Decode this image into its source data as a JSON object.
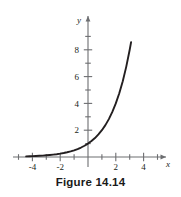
{
  "figure": {
    "caption": "Figure 14.14"
  },
  "chart_data": {
    "type": "line",
    "title": "",
    "subtitle": "",
    "xlabel": "x",
    "ylabel": "y",
    "grid": false,
    "legend": null,
    "xlim": [
      -4.6,
      4.6
    ],
    "ylim": [
      -0.55,
      9.2
    ],
    "x_ticks_major": [
      -4,
      -2,
      2,
      4
    ],
    "x_ticks_minor": [
      -3,
      -1,
      1,
      3
    ],
    "x_tick_labels": [
      "-4",
      "-2",
      "2",
      "4"
    ],
    "y_ticks_major": [
      2,
      4,
      6,
      8
    ],
    "y_ticks_minor": [
      1,
      3,
      5,
      7,
      9
    ],
    "y_tick_labels": [
      "2",
      "4",
      "6",
      "8"
    ],
    "series": [
      {
        "name": "exponential",
        "function": "y = 2^x",
        "color": "#231f20",
        "x": [
          -4.45,
          -4.2,
          -4.0,
          -3.75,
          -3.5,
          -3.25,
          -3.0,
          -2.75,
          -2.5,
          -2.25,
          -2.0,
          -1.75,
          -1.5,
          -1.25,
          -1.0,
          -0.75,
          -0.5,
          -0.25,
          0.0,
          0.25,
          0.5,
          0.75,
          1.0,
          1.25,
          1.5,
          1.75,
          2.0,
          2.25,
          2.5,
          2.75,
          3.0,
          3.1
        ],
        "y": [
          0.046,
          0.054,
          0.063,
          0.074,
          0.088,
          0.105,
          0.125,
          0.149,
          0.177,
          0.21,
          0.25,
          0.297,
          0.354,
          0.42,
          0.5,
          0.595,
          0.707,
          0.841,
          1.0,
          1.189,
          1.414,
          1.682,
          2.0,
          2.378,
          2.828,
          3.364,
          4.0,
          4.757,
          5.657,
          6.727,
          8.0,
          8.57
        ]
      }
    ],
    "axis_arrows": [
      "x-positive",
      "y-positive"
    ]
  },
  "icons": {
    "x_axis_arrow": "arrow-right-icon",
    "y_axis_arrow": "arrow-up-icon"
  },
  "colors": {
    "curve": "#231f20",
    "axis": "#6d6e71",
    "text": "#231f20",
    "caption": "#1a1a1a",
    "background": "#ffffff"
  }
}
